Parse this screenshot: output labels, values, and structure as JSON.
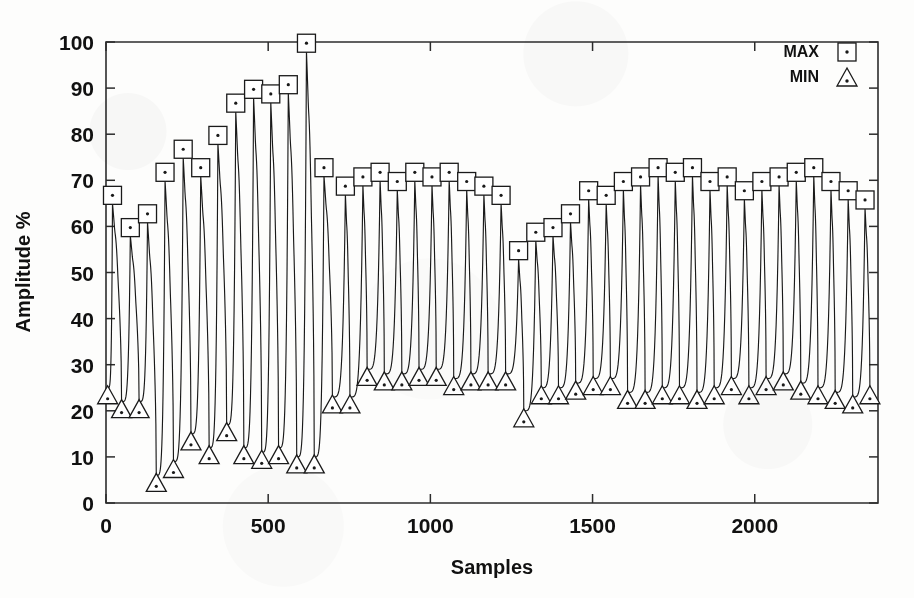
{
  "chart_data": {
    "type": "line",
    "title": "",
    "xlabel": "Samples",
    "ylabel": "Amplitude %",
    "xlim": [
      0,
      2380
    ],
    "ylim": [
      0,
      100
    ],
    "xticks": [
      0,
      500,
      1000,
      1500,
      2000
    ],
    "xticklabels": [
      "0",
      "500",
      "1000",
      "1500",
      "2000"
    ],
    "yticks": [
      0,
      10,
      20,
      30,
      40,
      50,
      60,
      70,
      80,
      90,
      100
    ],
    "yticklabels": [
      "0",
      "10",
      "20",
      "30",
      "40",
      "50",
      "60",
      "70",
      "80",
      "90",
      "100"
    ],
    "grid": false,
    "legend_position": "top-right",
    "legend": [
      {
        "label": "MAX",
        "marker": "square-with-dot"
      },
      {
        "label": "MIN",
        "marker": "triangle-with-dot"
      }
    ],
    "series": [
      {
        "name": "MAX",
        "marker": "square",
        "x": [
          20,
          75,
          128,
          182,
          238,
          292,
          345,
          400,
          455,
          508,
          562,
          618,
          672,
          738,
          792,
          845,
          898,
          952,
          1005,
          1058,
          1112,
          1165,
          1218,
          1272,
          1325,
          1378,
          1432,
          1488,
          1542,
          1595,
          1648,
          1702,
          1755,
          1808,
          1862,
          1915,
          1968,
          2022,
          2075,
          2128,
          2182,
          2235,
          2288,
          2340
        ],
        "values": [
          65,
          58,
          61,
          70,
          75,
          71,
          78,
          85,
          88,
          87,
          89,
          98,
          71,
          67,
          69,
          70,
          68,
          70,
          69,
          70,
          68,
          67,
          65,
          53,
          57,
          58,
          61,
          66,
          65,
          68,
          69,
          71,
          70,
          71,
          68,
          69,
          66,
          68,
          69,
          70,
          71,
          68,
          66,
          64
        ]
      },
      {
        "name": "MIN",
        "marker": "triangle",
        "x": [
          5,
          48,
          102,
          155,
          208,
          262,
          318,
          372,
          425,
          480,
          532,
          588,
          642,
          698,
          752,
          805,
          858,
          912,
          965,
          1018,
          1072,
          1125,
          1178,
          1232,
          1288,
          1342,
          1395,
          1448,
          1502,
          1555,
          1608,
          1662,
          1715,
          1768,
          1822,
          1875,
          1928,
          1982,
          2035,
          2088,
          2142,
          2195,
          2248,
          2302,
          2355
        ],
        "values": [
          25,
          22,
          22,
          6,
          9,
          15,
          12,
          17,
          12,
          11,
          12,
          10,
          10,
          23,
          23,
          29,
          28,
          28,
          29,
          29,
          27,
          28,
          28,
          28,
          20,
          25,
          25,
          26,
          27,
          27,
          24,
          24,
          25,
          25,
          24,
          25,
          27,
          25,
          27,
          28,
          26,
          25,
          24,
          23,
          25
        ]
      }
    ]
  },
  "axes": {
    "plot_left_px": 106,
    "plot_right_px": 878,
    "plot_top_px": 42,
    "plot_bottom_px": 503
  }
}
